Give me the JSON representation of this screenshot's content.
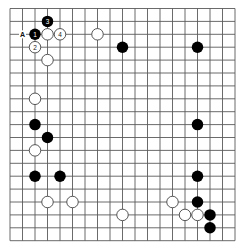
{
  "board": {
    "size": 19,
    "origin_x": 10,
    "origin_y": 8.5,
    "spacing_x": 12.5,
    "spacing_y": 12.9,
    "line_color": "#5a5a5a",
    "black_color": "#000000",
    "white_fill": "#ffffff",
    "white_stroke": "#444444"
  },
  "stones": [
    {
      "color": "black",
      "col": 3,
      "row": 1,
      "label": "3"
    },
    {
      "color": "black",
      "col": 2,
      "row": 2,
      "label": "1"
    },
    {
      "color": "white",
      "col": 3,
      "row": 2,
      "label": ""
    },
    {
      "color": "white",
      "col": 4,
      "row": 2,
      "label": "4"
    },
    {
      "color": "white",
      "col": 2,
      "row": 3,
      "label": "2"
    },
    {
      "color": "white",
      "col": 3,
      "row": 4,
      "label": ""
    },
    {
      "color": "white",
      "col": 7,
      "row": 2,
      "label": ""
    },
    {
      "color": "black",
      "col": 9,
      "row": 3,
      "label": ""
    },
    {
      "color": "black",
      "col": 15,
      "row": 3,
      "label": ""
    },
    {
      "color": "white",
      "col": 2,
      "row": 7,
      "label": ""
    },
    {
      "color": "black",
      "col": 2,
      "row": 9,
      "label": ""
    },
    {
      "color": "black",
      "col": 3,
      "row": 10,
      "label": ""
    },
    {
      "color": "white",
      "col": 2,
      "row": 11,
      "label": ""
    },
    {
      "color": "black",
      "col": 2,
      "row": 13,
      "label": ""
    },
    {
      "color": "black",
      "col": 4,
      "row": 13,
      "label": ""
    },
    {
      "color": "white",
      "col": 3,
      "row": 15,
      "label": ""
    },
    {
      "color": "white",
      "col": 5,
      "row": 15,
      "label": ""
    },
    {
      "color": "white",
      "col": 9,
      "row": 16,
      "label": ""
    },
    {
      "color": "black",
      "col": 15,
      "row": 9,
      "label": ""
    },
    {
      "color": "black",
      "col": 15,
      "row": 13,
      "label": ""
    },
    {
      "color": "white",
      "col": 13,
      "row": 15,
      "label": ""
    },
    {
      "color": "black",
      "col": 15,
      "row": 15,
      "label": ""
    },
    {
      "color": "white",
      "col": 14,
      "row": 16,
      "label": ""
    },
    {
      "color": "white",
      "col": 15,
      "row": 16,
      "label": ""
    },
    {
      "color": "black",
      "col": 16,
      "row": 16,
      "label": ""
    },
    {
      "color": "black",
      "col": 16,
      "row": 17,
      "label": ""
    }
  ],
  "markers": [
    {
      "col": 1,
      "row": 2,
      "label": "A"
    }
  ]
}
